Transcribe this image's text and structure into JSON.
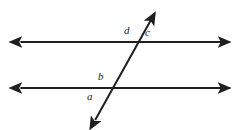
{
  "figure": {
    "name": "parallel-lines-cut-by-transversal",
    "background_color": "#ffffff",
    "stroke_color": "#1f1f1f",
    "label_color": "#1a1a1a",
    "width": 247,
    "height": 130
  },
  "labels": {
    "d": "d",
    "c": "c",
    "b": "b",
    "a": "a"
  },
  "chart_data": {
    "type": "diagram",
    "title": "",
    "xlabel": "",
    "ylabel": "",
    "xlim": [
      0,
      247
    ],
    "ylim": [
      0,
      130
    ],
    "grid": false,
    "legend": null,
    "elements": [
      {
        "id": "upper-parallel-line",
        "kind": "line",
        "arrows": "both",
        "x1": 18,
        "y1": 42,
        "x2": 232,
        "y2": 42,
        "stroke": "#1f1f1f",
        "stroke_width": 2
      },
      {
        "id": "lower-parallel-line",
        "kind": "line",
        "arrows": "both",
        "x1": 18,
        "y1": 88,
        "x2": 232,
        "y2": 88,
        "stroke": "#1f1f1f",
        "stroke_width": 2
      },
      {
        "id": "transversal-line",
        "kind": "line",
        "arrows": "both",
        "x1": 94,
        "y1": 122,
        "x2": 156,
        "y2": 11,
        "stroke": "#1f1f1f",
        "stroke_width": 2
      }
    ],
    "intersections": [
      {
        "id": "upper-intersection",
        "x": 136,
        "y": 42
      },
      {
        "id": "lower-intersection",
        "x": 110,
        "y": 88
      }
    ],
    "annotations": [
      {
        "id": "label-d",
        "text": "d",
        "x": 127,
        "y": 33,
        "position": "upper-left-of-upper-intersection"
      },
      {
        "id": "label-c",
        "text": "c",
        "x": 148,
        "y": 35,
        "position": "upper-right-of-upper-intersection"
      },
      {
        "id": "label-b",
        "text": "b",
        "x": 101,
        "y": 79,
        "position": "upper-left-of-lower-intersection"
      },
      {
        "id": "label-a",
        "text": "a",
        "x": 90,
        "y": 99,
        "position": "lower-left-of-lower-intersection"
      }
    ]
  }
}
